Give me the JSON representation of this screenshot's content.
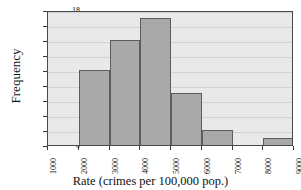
{
  "chart_data": {
    "type": "bar",
    "title": "",
    "subtitle": "",
    "xlabel": "Rate (crimes per 100,000 pop.)",
    "ylabel": "Frequency",
    "categories": [
      "1000-2000",
      "2000-3000",
      "3000-4000",
      "4000-5000",
      "5000-6000",
      "6000-7000",
      "7000-8000",
      "8000-9000"
    ],
    "bin_edges": [
      1000,
      2000,
      3000,
      4000,
      5000,
      6000,
      7000,
      8000,
      9000
    ],
    "values": [
      0,
      10,
      14,
      17,
      7,
      2,
      0,
      1
    ],
    "bars": [
      {
        "bin_start": 1000,
        "bin_end": 2000,
        "frequency": 0
      },
      {
        "bin_start": 2000,
        "bin_end": 3000,
        "frequency": 10
      },
      {
        "bin_start": 3000,
        "bin_end": 4000,
        "frequency": 14
      },
      {
        "bin_start": 4000,
        "bin_end": 5000,
        "frequency": 17
      },
      {
        "bin_start": 5000,
        "bin_end": 6000,
        "frequency": 7
      },
      {
        "bin_start": 6000,
        "bin_end": 7000,
        "frequency": 2
      },
      {
        "bin_start": 7000,
        "bin_end": 8000,
        "frequency": 0
      },
      {
        "bin_start": 8000,
        "bin_end": 9000,
        "frequency": 1
      }
    ],
    "xlim": [
      1000,
      9000
    ],
    "ylim": [
      0,
      18
    ],
    "xticks": [
      "1000",
      "2000",
      "3000",
      "4000",
      "5000",
      "6000",
      "7000",
      "8000",
      "9000"
    ],
    "xtick_values": [
      1000,
      2000,
      3000,
      4000,
      5000,
      6000,
      7000,
      8000,
      9000
    ],
    "yticks": [
      "0",
      "2",
      "4",
      "6",
      "8",
      "10",
      "12",
      "14",
      "16",
      "18"
    ],
    "ytick_values": [
      0,
      2,
      4,
      6,
      8,
      10,
      12,
      14,
      16,
      18
    ],
    "grid": true,
    "grid_axis": "y",
    "legend": false,
    "legend_position": "none",
    "xtick_rotation": 90,
    "colors": {
      "bar_fill": "#a9a9a9",
      "bar_edge": "#5d5d5d",
      "plot_background": "#e9e9e9",
      "figure_background": "#ffffff",
      "gridline": "#d2d2d2",
      "axis": "#4a4a4a",
      "text": "#111111"
    }
  },
  "axes": {
    "y_title": "Frequency",
    "x_title": "Rate (crimes per 100,000 pop.)"
  },
  "figure": {
    "cropped_title": ""
  }
}
